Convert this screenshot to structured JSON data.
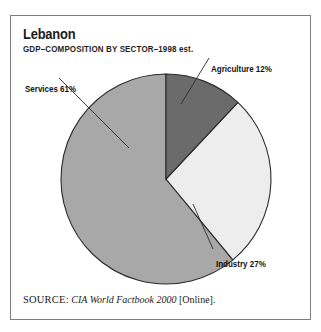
{
  "figure": {
    "title": "Lebanon",
    "subtitle": "GDP–COMPOSITION BY SECTOR–1998 est.",
    "source_label": "SOURCE:",
    "source_title": "CIA World Factbook 2000",
    "source_suffix": "[Online].",
    "border_color": "#7d7d7d",
    "background_color": "#ffffff"
  },
  "labels": {
    "services": "Services 61%",
    "agriculture": "Agriculture 12%",
    "industry": "Industry 27%"
  },
  "chart_data": {
    "type": "pie",
    "title": "Lebanon",
    "subtitle": "GDP–COMPOSITION BY SECTOR–1998 est.",
    "xlabel": "",
    "ylabel": "",
    "units": "percent of GDP",
    "year": "1998 est.",
    "start_angle_deg": 0,
    "direction": "clockwise",
    "grid": false,
    "legend": "none (direct labels with leader lines)",
    "total": 100,
    "categories": [
      "Agriculture",
      "Industry",
      "Services"
    ],
    "values": [
      12,
      27,
      61
    ],
    "slice_angles_deg": [
      43.2,
      97.2,
      219.6
    ],
    "colors": [
      "#6b6b6b",
      "#ededed",
      "#a8a8a8"
    ],
    "slices": [
      {
        "name": "Agriculture",
        "value": 12,
        "label": "Agriculture 12%",
        "color": "#6b6b6b",
        "start_deg": 0,
        "end_deg": 43.2
      },
      {
        "name": "Industry",
        "value": 27,
        "label": "Industry 27%",
        "color": "#ededed",
        "start_deg": 43.2,
        "end_deg": 140.4
      },
      {
        "name": "Services",
        "value": 61,
        "label": "Services 61%",
        "color": "#a8a8a8",
        "start_deg": 140.4,
        "end_deg": 360
      }
    ],
    "annotations": [
      "SOURCE: CIA World Factbook 2000 [Online]."
    ]
  }
}
